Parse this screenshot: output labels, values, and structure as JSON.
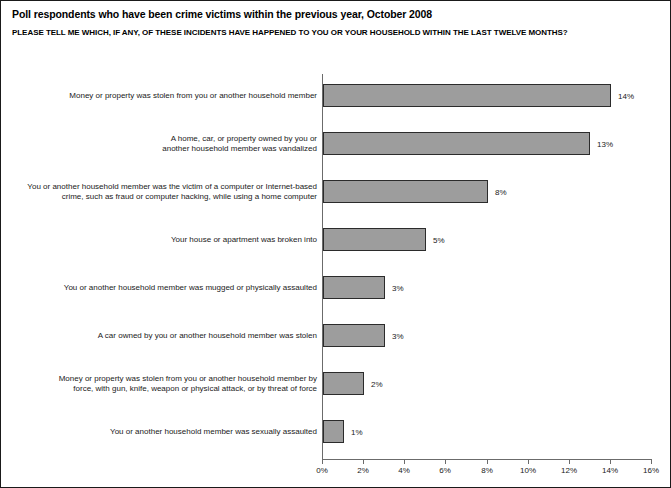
{
  "chart_data": {
    "type": "bar",
    "orientation": "horizontal",
    "title": "Poll respondents who have been crime victims within the previous year, October 2008",
    "subtitle": "PLEASE TELL ME WHICH, IF ANY, OF THESE INCIDENTS HAVE HAPPENED TO YOU OR YOUR HOUSEHOLD WITHIN THE LAST TWELVE MONTHS?",
    "xlabel": "",
    "ylabel": "",
    "xlim": [
      0,
      16
    ],
    "grid": false,
    "legend": null,
    "bar_color": "#9d9d9d",
    "bar_border_color": "#2b2b2b",
    "axis_color": "#6b6b6b",
    "tick_values": [
      0,
      2,
      4,
      6,
      8,
      10,
      12,
      14,
      16
    ],
    "tick_labels": [
      "0%",
      "2%",
      "4%",
      "6%",
      "8%",
      "10%",
      "12%",
      "14%",
      "16%"
    ],
    "categories": [
      "Money or property was stolen from you or another household member",
      "A home, car, or property owned by you or another household member was vandalized",
      "You or another household member was the victim of a computer or Internet-based crime, such as fraud or computer hacking, while using a home computer",
      "Your house or apartment was broken into",
      "You or another household member was mugged or physically assaulted",
      "A car owned by you or another household member was stolen",
      "Money or property was stolen from you or another household member by force, with gun, knife, weapon or physical attack, or by threat of force",
      "You or another household member was sexually assaulted"
    ],
    "values": [
      14,
      13,
      8,
      5,
      3,
      3,
      2,
      1
    ],
    "value_labels": [
      "14%",
      "13%",
      "8%",
      "5%",
      "3%",
      "3%",
      "2%",
      "1%"
    ],
    "category_lines": [
      [
        "Money or property was stolen from you or another household member"
      ],
      [
        "A home, car, or property owned by you or",
        "another household member was vandalized"
      ],
      [
        "You or another household member was the victim of a computer or Internet-based",
        "crime, such as fraud or computer hacking, while using a home computer"
      ],
      [
        "Your house or apartment was broken into"
      ],
      [
        "You or another household member was mugged or physically assaulted"
      ],
      [
        "A car owned by you or another household member was stolen"
      ],
      [
        "Money or property was stolen from you or another household member by",
        "force, with gun, knife, weapon or physical attack, or by threat of force"
      ],
      [
        "You or another household member was sexually assaulted"
      ]
    ]
  }
}
